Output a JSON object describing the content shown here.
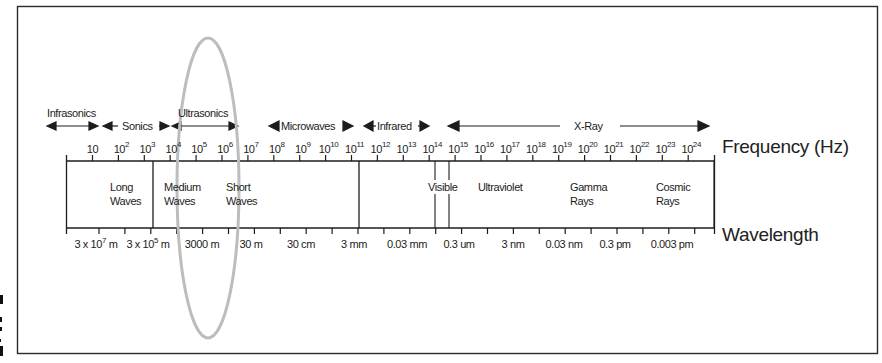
{
  "chart_data": {
    "type": "diagram",
    "title": "",
    "axes": {
      "frequency_axis_label": "Frequency (Hz)",
      "wavelength_axis_label": "Wavelength"
    },
    "frequency_ticks": [
      {
        "base": "10",
        "exp": ""
      },
      {
        "base": "10",
        "exp": "2"
      },
      {
        "base": "10",
        "exp": "3"
      },
      {
        "base": "10",
        "exp": "4"
      },
      {
        "base": "10",
        "exp": "5"
      },
      {
        "base": "10",
        "exp": "6"
      },
      {
        "base": "10",
        "exp": "7"
      },
      {
        "base": "10",
        "exp": "8"
      },
      {
        "base": "10",
        "exp": "9"
      },
      {
        "base": "10",
        "exp": "10"
      },
      {
        "base": "10",
        "exp": "11"
      },
      {
        "base": "10",
        "exp": "12"
      },
      {
        "base": "10",
        "exp": "13"
      },
      {
        "base": "10",
        "exp": "14"
      },
      {
        "base": "10",
        "exp": "15"
      },
      {
        "base": "10",
        "exp": "16"
      },
      {
        "base": "10",
        "exp": "17"
      },
      {
        "base": "10",
        "exp": "18"
      },
      {
        "base": "10",
        "exp": "19"
      },
      {
        "base": "10",
        "exp": "20"
      },
      {
        "base": "10",
        "exp": "21"
      },
      {
        "base": "10",
        "exp": "22"
      },
      {
        "base": "10",
        "exp": "23"
      },
      {
        "base": "10",
        "exp": "24"
      }
    ],
    "wavelength_labels": [
      {
        "text": "3 x 10",
        "exp": "7",
        "unit": " m"
      },
      {
        "text": "3 x 10",
        "exp": "5",
        "unit": " m"
      },
      {
        "text": "3000 m",
        "exp": "",
        "unit": ""
      },
      {
        "text": "30 m",
        "exp": "",
        "unit": ""
      },
      {
        "text": "30 cm",
        "exp": "",
        "unit": ""
      },
      {
        "text": "3 mm",
        "exp": "",
        "unit": ""
      },
      {
        "text": "0.03 mm",
        "exp": "",
        "unit": ""
      },
      {
        "text": "0.3 um",
        "exp": "",
        "unit": ""
      },
      {
        "text": "3 nm",
        "exp": "",
        "unit": ""
      },
      {
        "text": "0.03 nm",
        "exp": "",
        "unit": ""
      },
      {
        "text": "0.3 pm",
        "exp": "",
        "unit": ""
      },
      {
        "text": "0.003 pm",
        "exp": "",
        "unit": ""
      }
    ],
    "sound_ranges": [
      {
        "label": "Infrasonics"
      },
      {
        "label": "Sonics"
      },
      {
        "label": "Ultrasonics"
      }
    ],
    "em_ranges": [
      {
        "label": "Microwaves"
      },
      {
        "label": "Infrared"
      },
      {
        "label": "X-Ray"
      }
    ],
    "bands": [
      {
        "line1": "Long",
        "line2": "Waves"
      },
      {
        "line1": "Medium",
        "line2": "Waves"
      },
      {
        "line1": "Short",
        "line2": "Waves"
      },
      {
        "line1": "Visible",
        "line2": ""
      },
      {
        "line1": "Ultraviolet",
        "line2": ""
      },
      {
        "line1": "Gamma",
        "line2": "Rays"
      },
      {
        "line1": "Cosmic",
        "line2": "Rays"
      }
    ],
    "highlight": {
      "shape": "ellipse",
      "around": "Ultrasonics / 10^4–10^6 Hz",
      "color": "#bdbdbd"
    }
  },
  "colors": {
    "ink": "#1c1c1c",
    "frame": "#2a2a2a",
    "highlight": "#bdbdbd",
    "background": "#ffffff"
  }
}
